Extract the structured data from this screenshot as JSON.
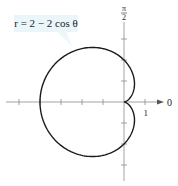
{
  "chart_data": {
    "type": "line",
    "subtype": "polar",
    "title": "",
    "equation_label": "r = 2 − 2 cos θ",
    "equation": {
      "a": 2,
      "b": -2,
      "trig": "cos"
    },
    "curve_name": "cardioid",
    "theta_range": [
      0,
      6.2832
    ],
    "axis_labels": {
      "polar_axis": "0",
      "vertical_axis": "π/2",
      "vertical_axis_num": "π",
      "vertical_axis_den": "2",
      "tick_one": "1"
    },
    "ticks": {
      "horizontal": [
        -5,
        -4,
        -3,
        -2,
        -1,
        1
      ],
      "vertical": [
        -3,
        -2,
        -1,
        1,
        2,
        3
      ]
    },
    "key_points": [
      {
        "theta": "0",
        "r": 0
      },
      {
        "theta": "π/2",
        "r": 2
      },
      {
        "theta": "π",
        "r": 4
      },
      {
        "theta": "3π/2",
        "r": 2
      }
    ],
    "xlim": [
      -5.6,
      1.9
    ],
    "ylim": [
      -3.7,
      4.4
    ],
    "grid": false,
    "colors": {
      "curve": "#1a1a1a",
      "axis": "#8a8a8a",
      "label_box": "#eaf6fa"
    }
  }
}
